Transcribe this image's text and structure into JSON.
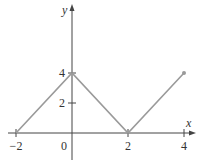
{
  "chart_data": {
    "type": "line",
    "title": "",
    "xlabel": "x",
    "ylabel": "y",
    "xlim": [
      -2.3,
      4.3
    ],
    "ylim": [
      -1.1,
      7.3
    ],
    "grid": false,
    "x_ticks": [
      -2,
      0,
      2,
      4
    ],
    "x_tick_labels": [
      "−2",
      "0",
      "2",
      "4"
    ],
    "y_ticks": [
      2,
      4
    ],
    "y_tick_labels": [
      "2",
      "4"
    ],
    "series": [
      {
        "name": "f(x)",
        "x": [
          -2,
          0,
          2,
          4
        ],
        "y": [
          0,
          4,
          0,
          4
        ],
        "color": "#9a9a9a",
        "endpoint_marker": {
          "x": 4,
          "y": 4,
          "style": "filled-dot"
        }
      }
    ]
  },
  "colors": {
    "axis": "#444444",
    "line": "#9a9a9a"
  }
}
